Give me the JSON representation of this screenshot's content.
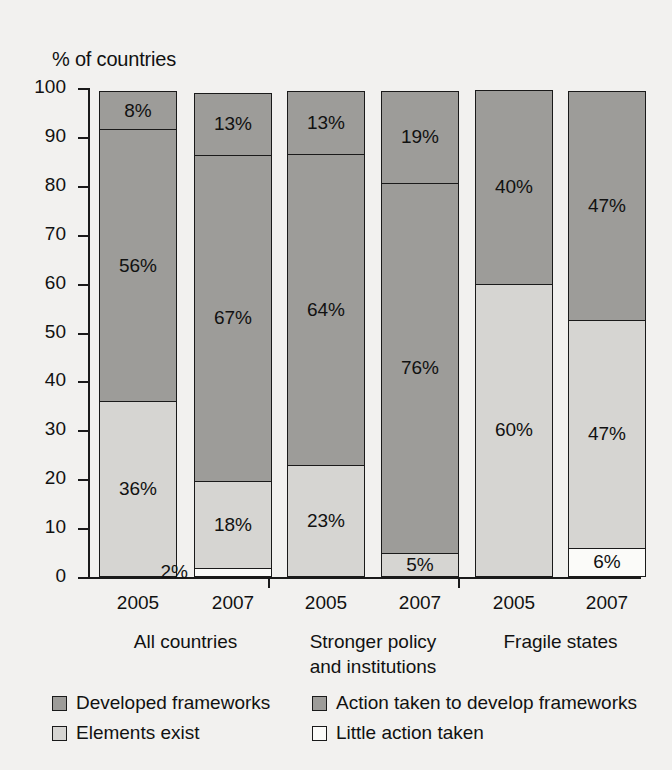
{
  "chart_data": {
    "type": "bar",
    "subtype": "stacked-vertical-100-percent",
    "title": "",
    "ylabel": "% of countries",
    "xlabel": "",
    "ylim": [
      0,
      100
    ],
    "yticks": [
      0,
      10,
      20,
      30,
      40,
      50,
      60,
      70,
      80,
      90,
      100
    ],
    "ytick_labels": [
      "0",
      "10",
      "20",
      "30",
      "40",
      "50",
      "60",
      "70",
      "80",
      "90",
      "100"
    ],
    "grid": false,
    "legend_position": "bottom",
    "categories": [
      "2005",
      "2007",
      "2005",
      "2007",
      "2005",
      "2007"
    ],
    "groups": [
      {
        "name": "All countries",
        "label_lines": [
          "All countries"
        ],
        "categories": [
          "2005",
          "2007"
        ]
      },
      {
        "name": "Stronger policy and institutions",
        "label_lines": [
          "Stronger policy",
          "and institutions"
        ],
        "categories": [
          "2005",
          "2007"
        ]
      },
      {
        "name": "Fragile states",
        "label_lines": [
          "Fragile states"
        ],
        "categories": [
          "2005",
          "2007"
        ]
      }
    ],
    "series": [
      {
        "name": "Little action taken",
        "color": "#fbfbf9",
        "values": [
          0,
          2,
          0,
          0,
          0,
          6
        ],
        "labels": [
          "",
          "2%",
          "",
          "",
          "",
          "6%"
        ]
      },
      {
        "name": "Elements exist",
        "color": "#d6d5d2",
        "values": [
          36,
          18,
          23,
          5,
          60,
          47
        ],
        "labels": [
          "36%",
          "18%",
          "23%",
          "5%",
          "60%",
          "47%"
        ]
      },
      {
        "name": "Action taken to develop frameworks",
        "color": "#9d9c99",
        "values": [
          56,
          67,
          64,
          76,
          0,
          0
        ],
        "labels": [
          "56%",
          "67%",
          "64%",
          "76%",
          "",
          ""
        ]
      },
      {
        "name": "Developed frameworks",
        "color": "#9d9c99",
        "values": [
          8,
          13,
          13,
          19,
          40,
          47
        ],
        "labels": [
          "8%",
          "13%",
          "13%",
          "19%",
          "40%",
          "47%"
        ]
      }
    ],
    "bars": [
      {
        "group": "All countries",
        "year": "2005",
        "segments": [
          {
            "series": "Elements exist",
            "value": 36,
            "label": "36%",
            "label_position": "inside"
          },
          {
            "series": "Action taken to develop frameworks",
            "value": 56,
            "label": "56%",
            "label_position": "inside"
          },
          {
            "series": "Developed frameworks",
            "value": 8,
            "label": "8%",
            "label_position": "inside"
          }
        ]
      },
      {
        "group": "All countries",
        "year": "2007",
        "segments": [
          {
            "series": "Little action taken",
            "value": 2,
            "label": "2%",
            "label_position": "outside-left"
          },
          {
            "series": "Elements exist",
            "value": 18,
            "label": "18%",
            "label_position": "inside"
          },
          {
            "series": "Action taken to develop frameworks",
            "value": 67,
            "label": "67%",
            "label_position": "inside"
          },
          {
            "series": "Developed frameworks",
            "value": 13,
            "label": "13%",
            "label_position": "inside"
          }
        ]
      },
      {
        "group": "Stronger policy and institutions",
        "year": "2005",
        "segments": [
          {
            "series": "Elements exist",
            "value": 23,
            "label": "23%",
            "label_position": "inside"
          },
          {
            "series": "Action taken to develop frameworks",
            "value": 64,
            "label": "64%",
            "label_position": "inside"
          },
          {
            "series": "Developed frameworks",
            "value": 13,
            "label": "13%",
            "label_position": "inside"
          }
        ]
      },
      {
        "group": "Stronger policy and institutions",
        "year": "2007",
        "segments": [
          {
            "series": "Elements exist",
            "value": 5,
            "label": "5%",
            "label_position": "inside"
          },
          {
            "series": "Action taken to develop frameworks",
            "value": 76,
            "label": "76%",
            "label_position": "inside"
          },
          {
            "series": "Developed frameworks",
            "value": 19,
            "label": "19%",
            "label_position": "inside"
          }
        ]
      },
      {
        "group": "Fragile states",
        "year": "2005",
        "segments": [
          {
            "series": "Elements exist",
            "value": 60,
            "label": "60%",
            "label_position": "inside"
          },
          {
            "series": "Developed frameworks",
            "value": 40,
            "label": "40%",
            "label_position": "inside"
          }
        ]
      },
      {
        "group": "Fragile states",
        "year": "2007",
        "segments": [
          {
            "series": "Little action taken",
            "value": 6,
            "label": "6%",
            "label_position": "inside"
          },
          {
            "series": "Elements exist",
            "value": 47,
            "label": "47%",
            "label_position": "inside"
          },
          {
            "series": "Developed frameworks",
            "value": 47,
            "label": "47%",
            "label_position": "inside"
          }
        ]
      }
    ]
  },
  "legend": {
    "items": [
      {
        "label": "Developed frameworks",
        "color": "#9d9c99"
      },
      {
        "label": "Action taken to develop frameworks",
        "color": "#9d9c99"
      },
      {
        "label": "Elements exist",
        "color": "#d6d5d2"
      },
      {
        "label": "Little action taken",
        "color": "#fbfbf9"
      }
    ]
  },
  "colors": {
    "background": "#f2f1ef",
    "axis": "#1a1a1a",
    "text": "#111111",
    "developed_frameworks": "#9d9c99",
    "action_taken": "#9d9c99",
    "elements_exist": "#d6d5d2",
    "little_action": "#fbfbf9"
  }
}
